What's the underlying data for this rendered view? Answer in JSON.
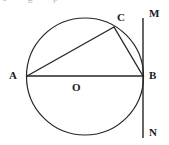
{
  "figure": {
    "background_color": "#ffffff",
    "stroke_color": "#262626",
    "label_color": "#1a1a1a",
    "cropped_text_remnant": "o g p",
    "canvas": {
      "width": 169,
      "height": 145
    },
    "circle": {
      "name": "main-circle",
      "center_x": 85,
      "center_y": 76.5,
      "radius": 58.5,
      "stroke_width": 1.2
    },
    "points": {
      "A": {
        "label": "A",
        "x": 27,
        "y": 76,
        "label_x": 9,
        "label_y": 70
      },
      "B": {
        "label": "B",
        "x": 143,
        "y": 76,
        "label_x": 149,
        "label_y": 70
      },
      "C": {
        "label": "C",
        "x": 114,
        "y": 27,
        "label_x": 117,
        "label_y": 12
      },
      "O": {
        "label": "O",
        "x": 85,
        "y": 76,
        "label_x": 72,
        "label_y": 82
      },
      "M": {
        "label": "M",
        "x": 143,
        "y": 18,
        "label_x": 149,
        "label_y": 8
      },
      "N": {
        "label": "N",
        "x": 143,
        "y": 138,
        "label_x": 149,
        "label_y": 127
      }
    },
    "segments": [
      {
        "name": "segment-AB-diameter",
        "from": "A",
        "to": "B",
        "x1": 27,
        "y1": 76,
        "x2": 143,
        "y2": 76,
        "stroke_width": 1.4
      },
      {
        "name": "segment-AC-chord",
        "from": "A",
        "to": "C",
        "x1": 27,
        "y1": 76,
        "x2": 114,
        "y2": 27,
        "stroke_width": 1.4
      },
      {
        "name": "segment-CB-chord",
        "from": "C",
        "to": "B",
        "x1": 114,
        "y1": 27,
        "x2": 143,
        "y2": 76,
        "stroke_width": 1.4
      },
      {
        "name": "line-MN-tangent",
        "from": "M",
        "to": "N",
        "x1": 143,
        "y1": 18,
        "x2": 143,
        "y2": 138,
        "stroke_width": 1.4
      }
    ]
  }
}
